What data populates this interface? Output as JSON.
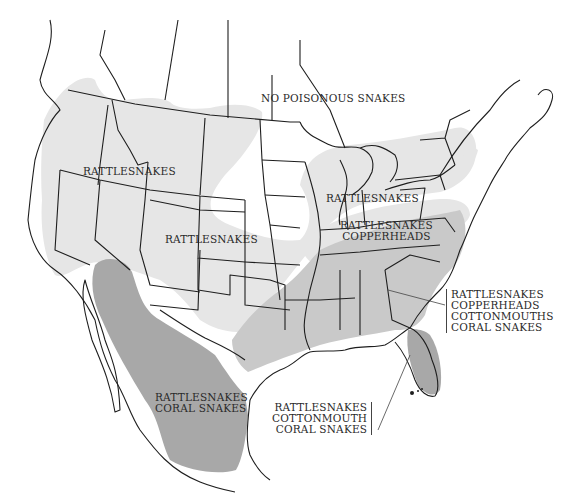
{
  "map": {
    "subject": "Venomous snake distribution in North America",
    "colors": {
      "background": "#ffffff",
      "light_zone": "#e6e6e6",
      "dark_zone": "#a8a8a8",
      "border": "#1e1e1e",
      "leader_line": "#444444"
    },
    "labels": {
      "no_poisonous": {
        "lines": [
          "NO POISONOUS SNAKES"
        ]
      },
      "west_rattlesnakes": {
        "lines": [
          "RATTLESNAKES"
        ]
      },
      "central_rattlesnakes": {
        "lines": [
          "RATTLESNAKES"
        ]
      },
      "great_lakes_rattlesnakes": {
        "lines": [
          "RATTLESNAKES"
        ]
      },
      "midatlantic": {
        "lines": [
          "RATTLESNAKES",
          "COPPERHEADS"
        ]
      },
      "southeast": {
        "lines": [
          "RATTLESNAKES",
          "COPPERHEADS",
          "COTTONMOUTHS",
          "CORAL SNAKES"
        ]
      },
      "florida": {
        "lines": [
          "RATTLESNAKES",
          "COTTONMOUTH",
          "CORAL SNAKES"
        ]
      },
      "mexico": {
        "lines": [
          "RATTLESNAKES",
          "CORAL SNAKES"
        ]
      }
    }
  }
}
